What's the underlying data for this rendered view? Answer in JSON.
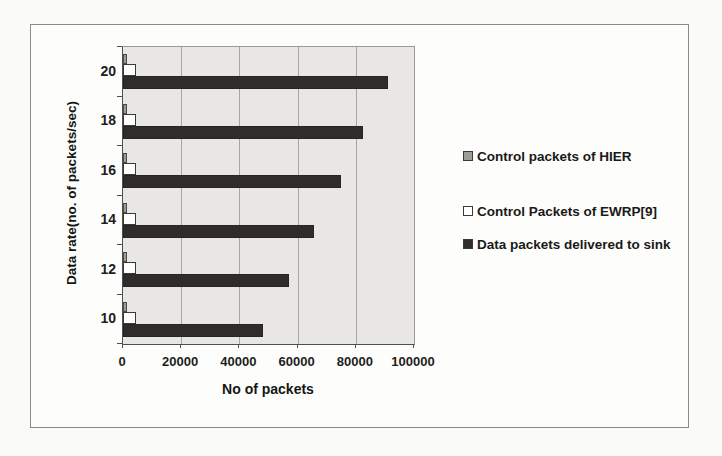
{
  "chart_data": {
    "type": "bar",
    "orientation": "horizontal",
    "title": "",
    "xlabel": "No of packets",
    "ylabel": "Data rate(no. of packets/sec)",
    "xlim": [
      0,
      100000
    ],
    "xticks": [
      0,
      20000,
      40000,
      60000,
      80000,
      100000
    ],
    "xtick_labels": [
      "0",
      "20000",
      "40000",
      "60000",
      "80000",
      "100000"
    ],
    "categories": [
      10,
      12,
      14,
      16,
      18,
      20
    ],
    "category_axis_order_top_to_bottom": [
      20,
      18,
      16,
      14,
      12,
      10
    ],
    "grid": "vertical gridlines on",
    "legend_position": "right",
    "plot_background_color": "#e9e7e4",
    "series": [
      {
        "name": "Control packets of HIER",
        "color": "#9c9c99",
        "values": [
          1500,
          1500,
          1500,
          1500,
          1500,
          1500
        ]
      },
      {
        "name": "Control Packets of EWRP[9]",
        "color": "#fefefe",
        "values": [
          4500,
          4500,
          4500,
          4500,
          4500,
          4500
        ]
      },
      {
        "name": "Data packets delivered to sink",
        "color": "#2e2d2b",
        "values": [
          48000,
          57000,
          65500,
          75000,
          82500,
          91000
        ]
      }
    ]
  }
}
